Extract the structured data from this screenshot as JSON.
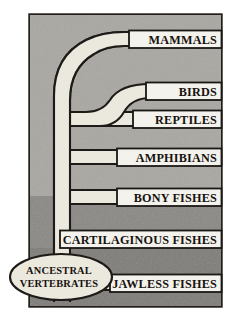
{
  "diagram": {
    "type": "phylogenetic-tree",
    "root": {
      "label_line1": "ANCESTRAL",
      "label_line2": "VERTEBRATES",
      "shape": "ellipse"
    },
    "colors": {
      "page_background": "#ffffff",
      "frame_border": "#221e1b",
      "panel_upper": "#a9a7a2",
      "panel_lower": "#868480",
      "branch_fill": "#ebe8de",
      "branch_stroke": "#1d1a17",
      "label_bar_fill": "#f4f2ec",
      "label_bar_stroke": "#1a1714",
      "text": "#16120f"
    },
    "branches": [
      {
        "id": "mammals",
        "label": "MAMMALS",
        "order": 1,
        "y": 41,
        "split_from": "trunk",
        "split_y": 38
      },
      {
        "id": "birds",
        "label": "BIRDS",
        "order": 2,
        "y": 93,
        "split_from": "reptiles",
        "split_y": 112
      },
      {
        "id": "reptiles",
        "label": "REPTILES",
        "order": 3,
        "y": 124,
        "split_from": "trunk",
        "split_y": 112
      },
      {
        "id": "amphibians",
        "label": "AMPHIBIANS",
        "order": 4,
        "y": 157,
        "split_from": "trunk",
        "split_y": 150
      },
      {
        "id": "bony-fishes",
        "label": "BONY FISHES",
        "order": 5,
        "y": 197,
        "split_from": "trunk",
        "split_y": 190
      },
      {
        "id": "cartilaginous-fishes",
        "label": "CARTILAGINOUS FISHES",
        "order": 6,
        "y": 239,
        "split_from": "trunk",
        "split_y": 232
      },
      {
        "id": "jawless-fishes",
        "label": "JAWLESS FISHES",
        "order": 7,
        "y": 283,
        "split_from": "trunk",
        "split_y": 276
      }
    ]
  }
}
